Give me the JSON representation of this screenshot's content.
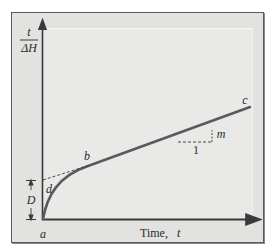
{
  "diagram": {
    "type": "plot-schematic",
    "y_axis_label_numerator": "t",
    "y_axis_label_denominator": "ΔH",
    "x_axis_label": "Time, t",
    "x_axis_label_word": "Time,",
    "x_axis_label_var": "t",
    "points": {
      "a": "a",
      "b": "b",
      "c": "c",
      "d": "d"
    },
    "intercept_label": "D",
    "slope_label": "m",
    "run_label": "1",
    "colors": {
      "frame_bg": "#e2e2e0",
      "panel_bg": "#e9e9e7",
      "curve": "#555555",
      "axes": "#3a3a3a",
      "dashed": "#3a3a3a"
    }
  }
}
